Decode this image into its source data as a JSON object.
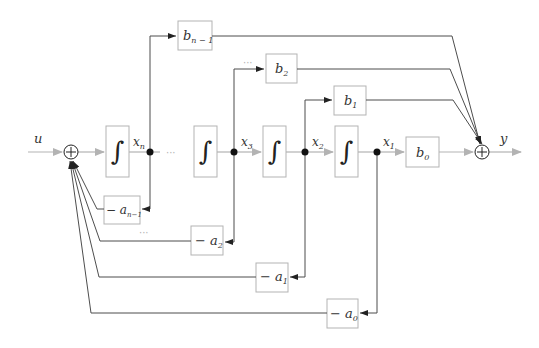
{
  "diagram": {
    "type": "block-diagram",
    "input_label": "u",
    "output_label": "y",
    "integrator_symbol": "∫",
    "sum_symbol": "+",
    "ellipsis": "···",
    "state_labels": {
      "xn": "x",
      "xn_sub": "n",
      "x3": "x",
      "x3_sub": "3",
      "x2": "x",
      "x2_sub": "2",
      "x1": "x",
      "x1_sub": "1"
    },
    "forward_gains": {
      "bn1": "b",
      "bn1_sub": "n − 1",
      "b2": "b",
      "b2_sub": "2",
      "b1": "b",
      "b1_sub": "1",
      "b0": "b",
      "b0_sub": "0"
    },
    "feedback_gains": {
      "an1_prefix": "− a",
      "an1_sub": "n−1",
      "a2_prefix": "− a",
      "a2_sub": "2",
      "a1_prefix": "− a",
      "a1_sub": "1",
      "a0_prefix": "− a",
      "a0_sub": "0"
    },
    "colors": {
      "forward_path": "#b3b3b3",
      "feedback_wire": "#4d4d4d",
      "box_stroke": "#b3b3b3",
      "node": "#111111"
    }
  }
}
